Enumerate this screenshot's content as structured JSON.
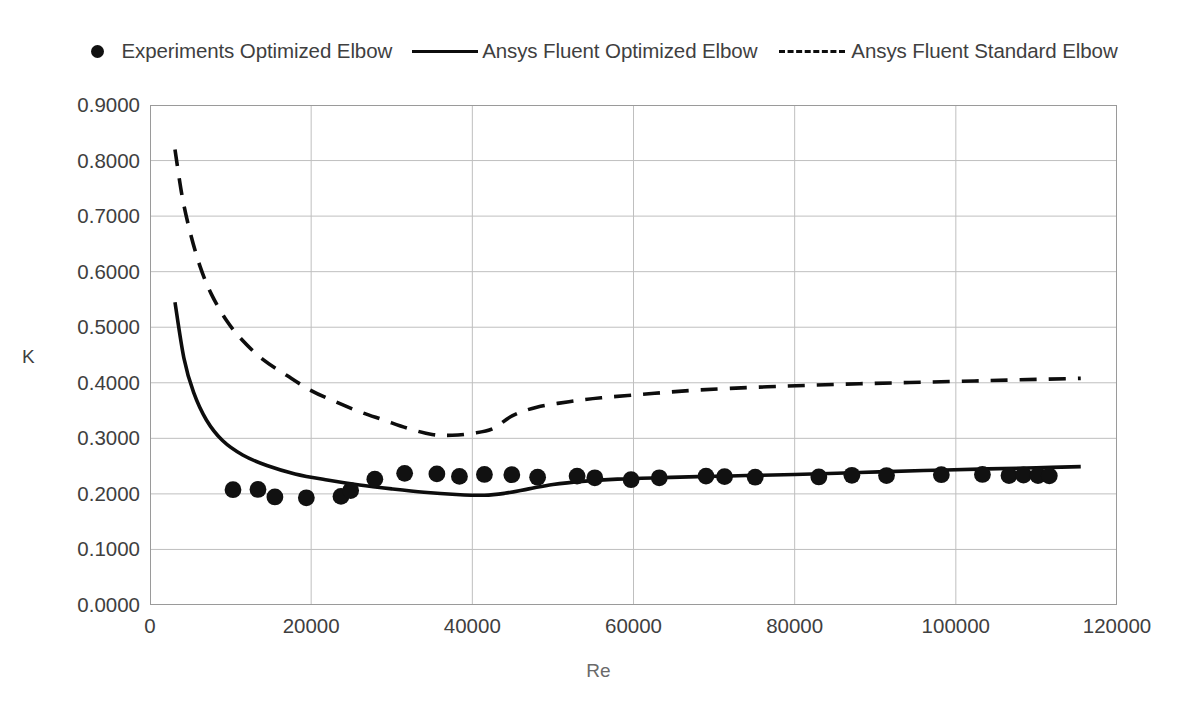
{
  "legend": {
    "position": "top",
    "entries": [
      {
        "label": "Experiments Optimized Elbow",
        "key": "scatter-marker-icon",
        "style": "marker"
      },
      {
        "label": "Ansys Fluent Optimized Elbow",
        "key": "solid-line-icon",
        "style": "solid"
      },
      {
        "label": "Ansys Fluent Standard Elbow",
        "key": "dashed-line-icon",
        "style": "dashed"
      }
    ]
  },
  "axes": {
    "x_title": "Re",
    "y_title": "K",
    "x_ticks": [
      "0",
      "20000",
      "40000",
      "60000",
      "80000",
      "100000",
      "120000"
    ],
    "y_ticks": [
      "0.9000",
      "0.8000",
      "0.7000",
      "0.6000",
      "0.5000",
      "0.4000",
      "0.3000",
      "0.2000",
      "0.1000",
      "0.0000"
    ]
  },
  "colors": {
    "line": "#0d0d0d",
    "marker": "#111111",
    "grid": "#bfbfbf",
    "frame": "#9a9a9a",
    "text": "#3f3f3f",
    "background": "#ffffff"
  },
  "chart_data": {
    "type": "scatter",
    "title": "",
    "xlabel": "Re",
    "ylabel": "K",
    "xlim": [
      0,
      120000
    ],
    "ylim": [
      0.0,
      0.9
    ],
    "xtick_step": 20000,
    "ytick_step": 0.1,
    "grid": true,
    "legend_position": "top",
    "series": [
      {
        "name": "Experiments Optimized Elbow",
        "type": "scatter",
        "marker": "circle",
        "points": [
          [
            10300,
            0.2075
          ],
          [
            13400,
            0.208
          ],
          [
            15500,
            0.1945
          ],
          [
            19400,
            0.193
          ],
          [
            23700,
            0.1955
          ],
          [
            24900,
            0.206
          ],
          [
            27900,
            0.2265
          ],
          [
            31600,
            0.237
          ],
          [
            35600,
            0.236
          ],
          [
            38400,
            0.2315
          ],
          [
            41500,
            0.235
          ],
          [
            44900,
            0.2345
          ],
          [
            48100,
            0.23
          ],
          [
            53000,
            0.232
          ],
          [
            55200,
            0.229
          ],
          [
            59700,
            0.2255
          ],
          [
            63200,
            0.229
          ],
          [
            69000,
            0.232
          ],
          [
            71300,
            0.231
          ],
          [
            75100,
            0.23
          ],
          [
            83000,
            0.2305
          ],
          [
            87100,
            0.2335
          ],
          [
            91400,
            0.233
          ],
          [
            98200,
            0.2345
          ],
          [
            103300,
            0.235
          ],
          [
            106600,
            0.233
          ],
          [
            108400,
            0.234
          ],
          [
            110200,
            0.233
          ],
          [
            111600,
            0.2325
          ]
        ]
      },
      {
        "name": "Ansys Fluent Optimized Elbow",
        "type": "line",
        "style": "solid",
        "points": [
          [
            3100,
            0.545
          ],
          [
            4200,
            0.445
          ],
          [
            5400,
            0.383
          ],
          [
            7000,
            0.333
          ],
          [
            9000,
            0.296
          ],
          [
            11500,
            0.27
          ],
          [
            14500,
            0.251
          ],
          [
            18000,
            0.236
          ],
          [
            22000,
            0.225
          ],
          [
            26000,
            0.216
          ],
          [
            30000,
            0.209
          ],
          [
            34000,
            0.203
          ],
          [
            38000,
            0.199
          ],
          [
            41500,
            0.1975
          ],
          [
            44000,
            0.201
          ],
          [
            47000,
            0.209
          ],
          [
            50000,
            0.217
          ],
          [
            54000,
            0.223
          ],
          [
            58000,
            0.2265
          ],
          [
            63000,
            0.229
          ],
          [
            68000,
            0.231
          ],
          [
            74000,
            0.233
          ],
          [
            80000,
            0.235
          ],
          [
            88000,
            0.2385
          ],
          [
            96000,
            0.242
          ],
          [
            104000,
            0.245
          ],
          [
            110000,
            0.247
          ],
          [
            115500,
            0.249
          ]
        ]
      },
      {
        "name": "Ansys Fluent Standard Elbow",
        "type": "line",
        "style": "dashed",
        "points": [
          [
            3100,
            0.82
          ],
          [
            4000,
            0.735
          ],
          [
            5000,
            0.67
          ],
          [
            6200,
            0.61
          ],
          [
            7600,
            0.56
          ],
          [
            9500,
            0.512
          ],
          [
            11500,
            0.476
          ],
          [
            14000,
            0.442
          ],
          [
            17000,
            0.413
          ],
          [
            20000,
            0.386
          ],
          [
            23000,
            0.366
          ],
          [
            26000,
            0.348
          ],
          [
            29000,
            0.333
          ],
          [
            32000,
            0.318
          ],
          [
            35000,
            0.307
          ],
          [
            37500,
            0.3055
          ],
          [
            40000,
            0.309
          ],
          [
            42500,
            0.317
          ],
          [
            45000,
            0.341
          ],
          [
            48000,
            0.356
          ],
          [
            52000,
            0.366
          ],
          [
            56000,
            0.373
          ],
          [
            61000,
            0.379
          ],
          [
            66000,
            0.385
          ],
          [
            72000,
            0.39
          ],
          [
            79000,
            0.394
          ],
          [
            86000,
            0.3975
          ],
          [
            93000,
            0.4
          ],
          [
            100000,
            0.4025
          ],
          [
            107000,
            0.405
          ],
          [
            115500,
            0.408
          ]
        ]
      }
    ]
  }
}
